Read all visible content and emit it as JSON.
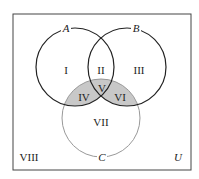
{
  "diagram": {
    "type": "venn",
    "universe_label": "U",
    "sets": [
      {
        "label": "A",
        "cx": 75,
        "cy": 67,
        "r": 39,
        "stroke": "#222222"
      },
      {
        "label": "B",
        "cx": 127,
        "cy": 67,
        "r": 39,
        "stroke": "#222222"
      },
      {
        "label": "C",
        "cx": 101,
        "cy": 118,
        "r": 39,
        "stroke": "#999999"
      }
    ],
    "regions": [
      {
        "label": "I",
        "x": 66,
        "y": 74
      },
      {
        "label": "II",
        "x": 101,
        "y": 74
      },
      {
        "label": "III",
        "x": 139,
        "y": 74
      },
      {
        "label": "IV",
        "x": 84,
        "y": 101
      },
      {
        "label": "V",
        "x": 102,
        "y": 92
      },
      {
        "label": "VI",
        "x": 120,
        "y": 101
      },
      {
        "label": "VII",
        "x": 101,
        "y": 126
      },
      {
        "label": "VIII",
        "x": 27,
        "y": 160
      }
    ],
    "shaded_regions": [
      "IV",
      "V",
      "VI"
    ],
    "shade_color": "#c8c8c8"
  }
}
